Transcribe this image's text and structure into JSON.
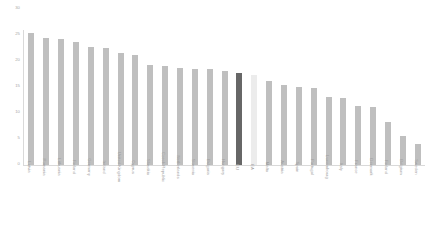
{
  "chart_data": {
    "type": "bar",
    "title": "",
    "subtitle": "",
    "xlabel": "",
    "ylabel": "",
    "ylim": [
      0,
      30
    ],
    "grid": false,
    "legend": "none",
    "ytick_labels": [
      "30",
      "25",
      "20",
      "15",
      "10",
      "5",
      "0"
    ],
    "ytick_values": [
      30,
      25,
      20,
      15,
      10,
      5,
      0
    ],
    "categories": [
      "Latvia",
      "Romania",
      "Lithuania",
      "Finland",
      "Germany",
      "Ireland",
      "United Kingdom",
      "Cyprus",
      "Slovakia",
      "Czech Republic",
      "Netherlands",
      "Slovenia",
      "Bulgaria",
      "Hungary",
      "EU",
      "EA",
      "Malta",
      "Austria",
      "Spain",
      "Portugal",
      "Luxembourg",
      "Italy",
      "France",
      "Denmark",
      "Finland",
      "Belgium",
      "Sweden"
    ],
    "values": [
      25.2,
      24.3,
      24.0,
      23.6,
      22.6,
      22.3,
      21.4,
      21.0,
      19.2,
      19.0,
      18.6,
      18.3,
      18.3,
      18.0,
      17.6,
      17.2,
      16.1,
      15.3,
      15.0,
      14.7,
      13.0,
      12.8,
      11.2,
      11.0,
      8.2,
      5.6,
      4.0
    ],
    "bar_colors": [
      "#bfbfbf",
      "#bfbfbf",
      "#bfbfbf",
      "#bfbfbf",
      "#bfbfbf",
      "#bfbfbf",
      "#bfbfbf",
      "#bfbfbf",
      "#bfbfbf",
      "#bfbfbf",
      "#bfbfbf",
      "#bfbfbf",
      "#bfbfbf",
      "#bfbfbf",
      "#676767",
      "#ececec",
      "#bfbfbf",
      "#bfbfbf",
      "#bfbfbf",
      "#bfbfbf",
      "#bfbfbf",
      "#bfbfbf",
      "#bfbfbf",
      "#bfbfbf",
      "#bfbfbf",
      "#bfbfbf",
      "#bfbfbf"
    ],
    "colors": {
      "default_bar": "#bfbfbf",
      "highlight_bar": "#676767",
      "secondary_bar": "#ececec",
      "axis": "#d9d9d9",
      "tick_text": "#a8a8a8",
      "label_text": "#a0a0a0",
      "background": "#ffffff"
    }
  }
}
